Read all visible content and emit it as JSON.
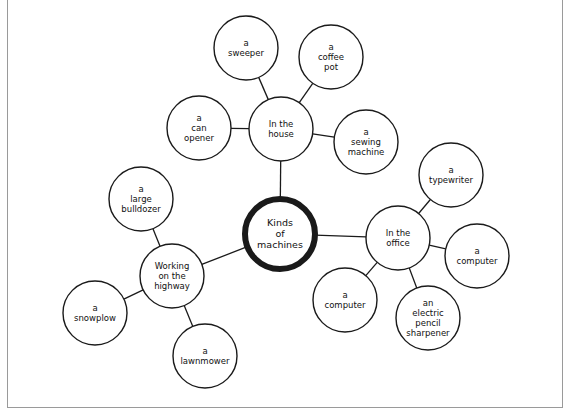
{
  "diagram": {
    "type": "semantic-web",
    "colors": {
      "stroke": "#1a1a1a",
      "background": "#ffffff",
      "frame": "#9a9a9a"
    },
    "center": {
      "id": "center",
      "lines": [
        "Kinds",
        "of",
        "machines"
      ],
      "x": 280,
      "y": 234,
      "r": 35,
      "stroke_width": 6
    },
    "categories": [
      {
        "id": "house",
        "lines": [
          "In the",
          "house"
        ],
        "x": 281,
        "y": 129,
        "r": 32,
        "items": [
          {
            "id": "sweeper",
            "lines": [
              "a",
              "sweeper"
            ],
            "x": 246,
            "y": 48,
            "r": 32
          },
          {
            "id": "coffee-pot",
            "lines": [
              "a",
              "coffee",
              "pot"
            ],
            "x": 331,
            "y": 57,
            "r": 32
          },
          {
            "id": "can-opener",
            "lines": [
              "a",
              "can",
              "opener"
            ],
            "x": 199,
            "y": 128,
            "r": 32
          },
          {
            "id": "sewing-machine",
            "lines": [
              "a",
              "sewing",
              "machine"
            ],
            "x": 366,
            "y": 142,
            "r": 32
          }
        ]
      },
      {
        "id": "office",
        "lines": [
          "In the",
          "office"
        ],
        "x": 398,
        "y": 238,
        "r": 32,
        "items": [
          {
            "id": "typewriter",
            "lines": [
              "a",
              "typewriter"
            ],
            "x": 451,
            "y": 175,
            "r": 32
          },
          {
            "id": "computer-right",
            "lines": [
              "a",
              "computer"
            ],
            "x": 477,
            "y": 256,
            "r": 32
          },
          {
            "id": "computer-left",
            "lines": [
              "a",
              "computer"
            ],
            "x": 345,
            "y": 300,
            "r": 32
          },
          {
            "id": "pencil-sharpener",
            "lines": [
              "an",
              "electric",
              "pencil",
              "sharpener"
            ],
            "x": 428,
            "y": 318,
            "r": 32
          }
        ]
      },
      {
        "id": "highway",
        "lines": [
          "Working",
          "on the",
          "highway"
        ],
        "x": 172,
        "y": 276,
        "r": 32,
        "items": [
          {
            "id": "bulldozer",
            "lines": [
              "a",
              "large",
              "bulldozer"
            ],
            "x": 141,
            "y": 199,
            "r": 32
          },
          {
            "id": "snowplow",
            "lines": [
              "a",
              "snowplow"
            ],
            "x": 95,
            "y": 313,
            "r": 32
          },
          {
            "id": "lawnmower",
            "lines": [
              "a",
              "lawnmower"
            ],
            "x": 205,
            "y": 356,
            "r": 32
          }
        ]
      }
    ]
  }
}
